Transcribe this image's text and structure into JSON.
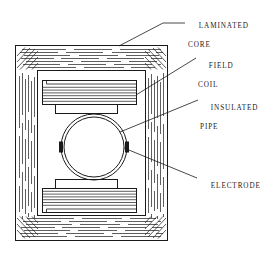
{
  "diagram": {
    "type": "technical-line-drawing",
    "background_color": "#ffffff",
    "line_color": "#1a1a1a",
    "callouts": [
      {
        "id": "laminated-core",
        "line1": "LAMINATED",
        "line2": "CORE",
        "leader_from": [
          119,
          46
        ],
        "leader_to": [
          185,
          18
        ]
      },
      {
        "id": "field-coil",
        "line1": "FIELD",
        "line2": "COIL",
        "leader_from": [
          136,
          95
        ],
        "leader_to": [
          196,
          58
        ]
      },
      {
        "id": "insulated-pipe",
        "line1": "INSULATED",
        "line2": "PIPE",
        "leader_from": [
          120,
          132
        ],
        "leader_to": [
          198,
          100
        ]
      },
      {
        "id": "electrode",
        "line1": "ELECTRODE",
        "line2": "",
        "leader_from": [
          124,
          148
        ],
        "leader_to": [
          197,
          178
        ]
      }
    ],
    "parts": {
      "laminated_core": {
        "name": "LAMINATED CORE",
        "outer_rect": [
          15,
          45,
          153,
          196
        ],
        "window_rect": [
          37,
          70,
          109,
          146
        ],
        "hatch": "laminations"
      },
      "field_coil_top": {
        "name": "FIELD COIL",
        "rect": [
          42,
          80,
          95,
          25
        ],
        "stripes": 7
      },
      "field_coil_bottom": {
        "name": "FIELD COIL",
        "rect": [
          42,
          188,
          95,
          25
        ],
        "stripes": 7
      },
      "insulated_pipe": {
        "name": "INSULATED PIPE",
        "center": [
          94,
          147
        ],
        "outer_radius": 33,
        "inner_radius": 30
      },
      "electrode_left": {
        "name": "ELECTRODE",
        "rect": [
          59,
          142,
          4,
          11
        ]
      },
      "electrode_right": {
        "name": "ELECTRODE",
        "rect": [
          125,
          142,
          4,
          11
        ]
      }
    }
  }
}
